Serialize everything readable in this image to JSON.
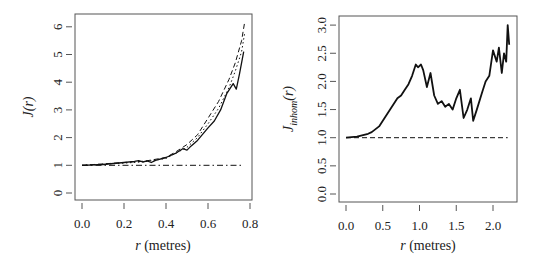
{
  "chart_data": [
    {
      "type": "line",
      "title": "",
      "xlabel": "r (metres)",
      "ylabel": "J(r)",
      "xlim": [
        0,
        0.8
      ],
      "ylim": [
        0,
        6.2
      ],
      "x_ticks": [
        "0.0",
        "0.2",
        "0.4",
        "0.6",
        "0.8"
      ],
      "y_ticks": [
        "0",
        "1",
        "2",
        "3",
        "4",
        "5",
        "6"
      ],
      "grid": false,
      "legend": null,
      "series": [
        {
          "name": "empirical (solid)",
          "style": "solid",
          "x": [
            0.0,
            0.1,
            0.2,
            0.25,
            0.27,
            0.29,
            0.31,
            0.33,
            0.35,
            0.4,
            0.45,
            0.48,
            0.5,
            0.52,
            0.55,
            0.6,
            0.63,
            0.66,
            0.69,
            0.72,
            0.735,
            0.75,
            0.77
          ],
          "y": [
            1.0,
            1.03,
            1.1,
            1.14,
            1.17,
            1.12,
            1.16,
            1.1,
            1.18,
            1.28,
            1.45,
            1.6,
            1.55,
            1.7,
            1.9,
            2.35,
            2.6,
            3.0,
            3.6,
            3.95,
            3.75,
            4.3,
            5.1
          ]
        },
        {
          "name": "upper envelope (dashed)",
          "style": "dashed",
          "x": [
            0.0,
            0.2,
            0.3,
            0.4,
            0.45,
            0.5,
            0.55,
            0.6,
            0.65,
            0.7,
            0.73,
            0.76,
            0.775
          ],
          "y": [
            1.0,
            1.1,
            1.15,
            1.28,
            1.5,
            1.75,
            2.1,
            2.7,
            3.3,
            4.1,
            4.7,
            5.5,
            6.2
          ]
        },
        {
          "name": "lower envelope (dotted)",
          "style": "dotted",
          "x": [
            0.0,
            0.2,
            0.3,
            0.4,
            0.45,
            0.5,
            0.55,
            0.6,
            0.65,
            0.7,
            0.73,
            0.76,
            0.775
          ],
          "y": [
            1.0,
            1.08,
            1.13,
            1.25,
            1.45,
            1.65,
            2.0,
            2.5,
            3.05,
            3.8,
            4.4,
            5.1,
            5.8
          ]
        },
        {
          "name": "Poisson reference (dot-dash)",
          "style": "dotdash",
          "x": [
            0.0,
            0.77
          ],
          "y": [
            1.0,
            1.0
          ]
        }
      ]
    },
    {
      "type": "line",
      "title": "",
      "xlabel": "r (metres)",
      "ylabel": "J_inhom(r)",
      "xlim": [
        0,
        2.3
      ],
      "ylim": [
        0,
        3.1
      ],
      "x_ticks": [
        "0.0",
        "0.5",
        "1.0",
        "1.5",
        "2.0"
      ],
      "y_ticks": [
        "0.0",
        "0.5",
        "1.0",
        "1.5",
        "2.0",
        "2.5",
        "3.0"
      ],
      "grid": false,
      "legend": null,
      "series": [
        {
          "name": "empirical (solid)",
          "style": "solid",
          "x": [
            0.0,
            0.15,
            0.3,
            0.35,
            0.45,
            0.5,
            0.6,
            0.7,
            0.75,
            0.8,
            0.85,
            0.9,
            0.95,
            0.98,
            1.02,
            1.05,
            1.1,
            1.15,
            1.2,
            1.25,
            1.3,
            1.35,
            1.4,
            1.45,
            1.5,
            1.55,
            1.6,
            1.65,
            1.7,
            1.73,
            1.78,
            1.85,
            1.9,
            1.95,
            2.0,
            2.05,
            2.08,
            2.12,
            2.15,
            2.18,
            2.2,
            2.22
          ],
          "y": [
            1.0,
            1.02,
            1.07,
            1.1,
            1.2,
            1.3,
            1.5,
            1.7,
            1.75,
            1.85,
            1.95,
            2.1,
            2.3,
            2.25,
            2.3,
            2.2,
            1.9,
            2.15,
            1.75,
            1.6,
            1.65,
            1.55,
            1.6,
            1.5,
            1.7,
            1.85,
            1.35,
            1.5,
            1.7,
            1.3,
            1.5,
            1.8,
            2.0,
            2.1,
            2.55,
            2.35,
            2.6,
            2.15,
            2.5,
            2.35,
            3.0,
            2.65
          ]
        },
        {
          "name": "Poisson reference (dashed)",
          "style": "dashed",
          "x": [
            0.0,
            2.2
          ],
          "y": [
            1.0,
            1.0
          ]
        }
      ]
    }
  ],
  "left_plot": {
    "ylabel_main": "J",
    "ylabel_arg": "(r)",
    "xlabel_var": "r",
    "xlabel_unit": " (metres)",
    "x_ticks": [
      "0.0",
      "0.2",
      "0.4",
      "0.6",
      "0.8"
    ],
    "y_ticks": [
      "0",
      "1",
      "2",
      "3",
      "4",
      "5",
      "6"
    ]
  },
  "right_plot": {
    "ylabel_main": "J",
    "ylabel_sub": "inhom",
    "ylabel_arg": "(r)",
    "xlabel_var": "r",
    "xlabel_unit": " (metres)",
    "x_ticks": [
      "0.0",
      "0.5",
      "1.0",
      "1.5",
      "2.0"
    ],
    "y_ticks": [
      "0.0",
      "0.5",
      "1.0",
      "1.5",
      "2.0",
      "2.5",
      "3.0"
    ]
  }
}
